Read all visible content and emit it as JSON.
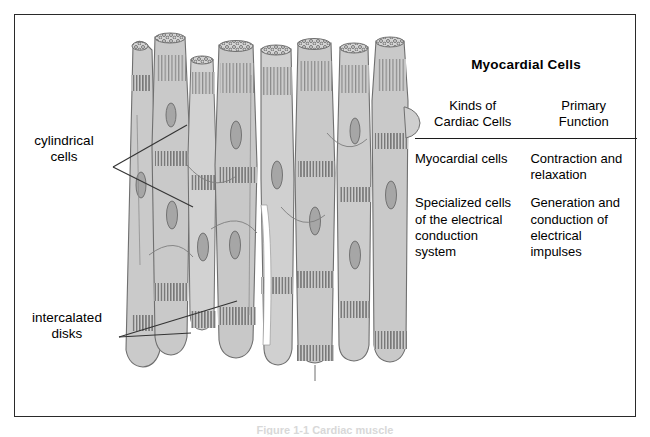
{
  "figure": {
    "labels": {
      "cylindrical_cells": "cylindrical\ncells",
      "cylindrical_cells_line1": "cylindrical",
      "cylindrical_cells_line2": "cells",
      "intercalated_disks_line1": "intercalated",
      "intercalated_disks_line2": "disks"
    },
    "caption": "Figure 1-1  Cardiac muscle"
  },
  "table": {
    "title": "Myocardial Cells",
    "headers": [
      {
        "line1": "Kinds of",
        "line2": "Cardiac Cells"
      },
      {
        "line1": "Primary",
        "line2": "Function"
      }
    ],
    "rows": [
      {
        "kind": "Myocardial cells",
        "function": "Contraction and relaxation"
      },
      {
        "kind": "Specialized cells of the electrical conduction system",
        "function": "Generation and conduction of electrical impulses"
      }
    ]
  },
  "colors": {
    "border": "#2a2a2a",
    "cell_fill": "#c9c9c9",
    "cell_fill_light": "#d6d6d6",
    "cell_outline": "#6f6f6f",
    "disk_stripe": "#7a7a7a",
    "nucleus": "#a6a6a6",
    "nucleus_outline": "#6a6a6a",
    "text": "#000000",
    "background": "#ffffff"
  }
}
